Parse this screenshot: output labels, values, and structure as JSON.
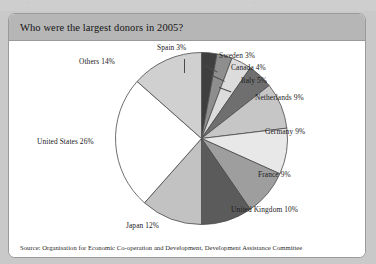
{
  "panel": {
    "title": "Who were the largest donors in 2005?",
    "source": "Source: Organisation for Economic Co-operation and Development, Development Assistance Committee"
  },
  "top_strip": {
    "ghost_left": "·",
    "ghost_right": "·"
  },
  "labels": {
    "spain": "Spain 3%",
    "sweden": "Sweden 3%",
    "canada": "Canada 4%",
    "italy": "Italy 5%",
    "netherlands": "Netherlands 9%",
    "germany": "Germany 9%",
    "france": "France 9%",
    "united_kingdom": "United Kingdom 10%",
    "japan": "Japan 12%",
    "united_states": "United States 26%",
    "others": "Others 14%"
  },
  "chart_data": {
    "type": "pie",
    "title": "Who were the largest donors in 2005?",
    "xlabel": "",
    "ylabel": "",
    "legend": "none",
    "grid": false,
    "start_angle_deg": 0,
    "direction": "clockwise",
    "units": "percent",
    "categories": [
      "Spain",
      "Sweden",
      "Canada",
      "Italy",
      "Netherlands",
      "Germany",
      "France",
      "United Kingdom",
      "Japan",
      "United States",
      "Others"
    ],
    "values": [
      3,
      3,
      4,
      5,
      9,
      9,
      9,
      10,
      12,
      26,
      14
    ],
    "data_labels": [
      "Spain 3%",
      "Sweden 3%",
      "Canada 4%",
      "Italy 5%",
      "Netherlands 9%",
      "Germany 9%",
      "France 9%",
      "United Kingdom 10%",
      "Japan 12%",
      "United States 26%",
      "Others 14%"
    ],
    "colors": [
      "#3f3f3f",
      "#8e8e8e",
      "#dcdcdc",
      "#6f6f6f",
      "#c6c6c6",
      "#e8e8e8",
      "#9e9e9e",
      "#5b5b5b",
      "#c2c2c2",
      "#ffffff",
      "#d0d0d0"
    ],
    "slice_edge_color": "#4a4a4a",
    "annotation": "Source: Organisation for Economic Co-operation and Development, Development Assistance Committee"
  }
}
